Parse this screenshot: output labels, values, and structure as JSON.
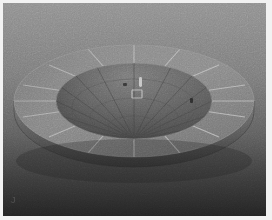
{
  "image": {
    "title": "3D rendered dish",
    "subject": "parabolic-bowl",
    "description": "Grayscale 3D render of a shallow parabolic bowl with a flat segmented annular rim seen in perspective from slightly above",
    "width_px": 272,
    "height_px": 220,
    "colorspace": "grayscale",
    "corner_mark_glyph": "J"
  },
  "frame": {
    "border_color": "#f2f2f2",
    "border_width_px": 3,
    "right_border_width_px": 6,
    "bottom_border_width_px": 4
  },
  "background": {
    "type": "vertical-gradient",
    "top_color": "#8e8e8e",
    "mid_color": "#6d6d6d",
    "bottom_color": "#262626",
    "stops": [
      {
        "offset": "0%",
        "color": "#909090"
      },
      {
        "offset": "35%",
        "color": "#7a7a7a"
      },
      {
        "offset": "62%",
        "color": "#5e5e5e"
      },
      {
        "offset": "82%",
        "color": "#3c3c3c"
      },
      {
        "offset": "100%",
        "color": "#232323"
      }
    ]
  },
  "object": {
    "name": "segmented-bowl",
    "rim": {
      "label": "annular-rim",
      "outer_rx": 120,
      "outer_ry": 56,
      "inner_rx": 78,
      "inner_ry": 38,
      "center_x": 131,
      "center_y": 98,
      "fill_light": "#8f8f8f",
      "fill_dark": "#6c6c6c",
      "segment_count": 16,
      "segment_line_color": "#b9b9b9",
      "segment_line_width": 1
    },
    "side_wall": {
      "label": "outer-side-wall",
      "height_px": 40,
      "fill_light": "#6a6a6a",
      "fill_dark": "#3a3a3a"
    },
    "cavity": {
      "label": "concave-interior",
      "rx": 78,
      "ry": 38,
      "center_x": 131,
      "center_y": 98,
      "fill_light": "#707070",
      "fill_dark": "#3e3e3e",
      "meridian_count": 14,
      "meridian_color": "#3a3a3a",
      "focus_x": 131,
      "focus_y": 140
    },
    "highlights": [
      {
        "name": "specular-streak",
        "x": 136,
        "y": 76,
        "w": 3,
        "h": 9,
        "color": "#d4d4d4"
      },
      {
        "name": "square-marker",
        "x": 130,
        "y": 88,
        "w": 9,
        "h": 7,
        "color": "#c8c8c8"
      },
      {
        "name": "dark-speck-left",
        "x": 121,
        "y": 81,
        "w": 3,
        "h": 3,
        "color": "#2e2e2e"
      },
      {
        "name": "dark-speck-right",
        "x": 188,
        "y": 96,
        "w": 3,
        "h": 4,
        "color": "#2b2b2b"
      }
    ]
  }
}
